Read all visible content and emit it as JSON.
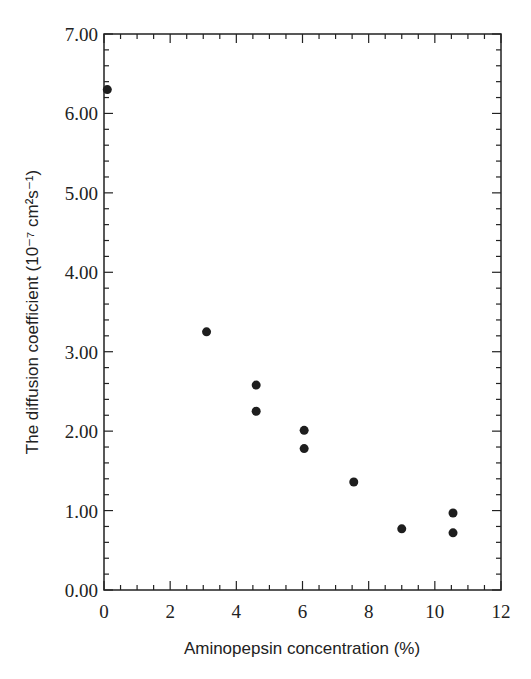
{
  "chart_data": {
    "type": "scatter",
    "title": "",
    "xlabel": "Aminopepsin concentration (%)",
    "ylabel": "The diffusion coefficient (10⁻⁷ cm²s⁻¹)",
    "xlim": [
      0,
      12
    ],
    "ylim": [
      0,
      7
    ],
    "x_ticks": [
      "0",
      "2",
      "4",
      "6",
      "8",
      "10",
      "12"
    ],
    "y_ticks": [
      "0.00",
      "1.00",
      "2.00",
      "3.00",
      "4.00",
      "5.00",
      "6.00",
      "7.00"
    ],
    "grid": false,
    "legend": null,
    "series": [
      {
        "name": "diffusion coefficient",
        "points": [
          {
            "x": 0.1,
            "y": 6.3
          },
          {
            "x": 3.1,
            "y": 3.25
          },
          {
            "x": 4.6,
            "y": 2.58
          },
          {
            "x": 4.6,
            "y": 2.25
          },
          {
            "x": 6.05,
            "y": 2.01
          },
          {
            "x": 6.05,
            "y": 1.78
          },
          {
            "x": 7.55,
            "y": 1.36
          },
          {
            "x": 9.0,
            "y": 0.77
          },
          {
            "x": 10.55,
            "y": 0.97
          },
          {
            "x": 10.55,
            "y": 0.72
          }
        ]
      }
    ]
  }
}
